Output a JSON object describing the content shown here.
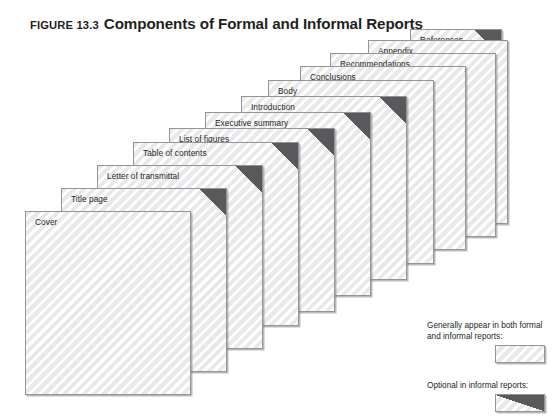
{
  "figure": {
    "kicker": "FIGURE 13.3",
    "title": "Components of Formal and Informal Reports"
  },
  "colors": {
    "page_fill": "#f2f2f2",
    "page_border": "#929497",
    "corner_fill": "#58595b",
    "text": "#231f20",
    "background": "#ffffff"
  },
  "stack": {
    "pages": [
      {
        "label": "Cover",
        "optional_corner": false,
        "left": 25,
        "top": 211,
        "width": 166,
        "height": 184
      },
      {
        "label": "Title page",
        "optional_corner": true,
        "left": 61,
        "top": 188,
        "width": 166,
        "height": 184
      },
      {
        "label": "Letter of transmittal",
        "optional_corner": true,
        "left": 97,
        "top": 165,
        "width": 166,
        "height": 184
      },
      {
        "label": "Table of contents",
        "optional_corner": true,
        "left": 133,
        "top": 142,
        "width": 166,
        "height": 184
      },
      {
        "label": "List of figures",
        "optional_corner": true,
        "left": 169,
        "top": 128,
        "width": 166,
        "height": 184
      },
      {
        "label": "Executive summary",
        "optional_corner": true,
        "left": 205,
        "top": 112,
        "width": 166,
        "height": 184
      },
      {
        "label": "Introduction",
        "optional_corner": true,
        "left": 241,
        "top": 96,
        "width": 166,
        "height": 184
      },
      {
        "label": "Body",
        "optional_corner": false,
        "left": 268,
        "top": 80,
        "width": 166,
        "height": 184
      },
      {
        "label": "Conclusions",
        "optional_corner": false,
        "left": 300,
        "top": 66,
        "width": 166,
        "height": 184
      },
      {
        "label": "Recommendations",
        "optional_corner": false,
        "left": 330,
        "top": 53,
        "width": 166,
        "height": 184
      },
      {
        "label": "Appendix",
        "optional_corner": false,
        "left": 368,
        "top": 40,
        "width": 140,
        "height": 184
      },
      {
        "label": "References",
        "optional_corner": true,
        "left": 410,
        "top": 29,
        "width": 92,
        "height": 155
      }
    ]
  },
  "legend": {
    "items": [
      {
        "text": "Generally appear in both formal and informal reports:",
        "swatch": "plain-page-swatch",
        "optional_corner": false
      },
      {
        "text": "Optional in informal reports:",
        "swatch": "optional-page-swatch",
        "optional_corner": true
      }
    ]
  }
}
